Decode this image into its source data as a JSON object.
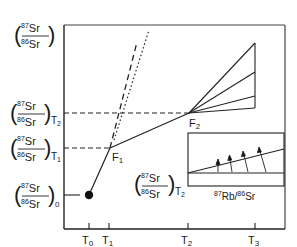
{
  "diagram": {
    "y_axis_label": {
      "num": "87Sr",
      "num_sup": "87",
      "num_base": "Sr",
      "den_sup": "86",
      "den_base": "Sr"
    },
    "y_ticks": [
      {
        "sub": "T2",
        "sub_base": "T",
        "sub_idx": "2"
      },
      {
        "sub": "T1",
        "sub_base": "T",
        "sub_idx": "1"
      },
      {
        "sub": "0",
        "sub_base": "",
        "sub_idx": "0"
      }
    ],
    "x_ticks": [
      {
        "label": "T",
        "idx": "0"
      },
      {
        "label": "T",
        "idx": "1"
      },
      {
        "label": "T",
        "idx": "2"
      },
      {
        "label": "T",
        "idx": "3"
      }
    ],
    "points": [
      {
        "label": "F",
        "idx": "1"
      },
      {
        "label": "F",
        "idx": "2"
      }
    ],
    "inset": {
      "y_label_sub": "T2",
      "y_label_sub_base": "T",
      "y_label_sub_idx": "2",
      "x_label_sup1": "87",
      "x_label_base1": "Rb/",
      "x_label_sup2": "86",
      "x_label_base2": "Sr"
    }
  }
}
